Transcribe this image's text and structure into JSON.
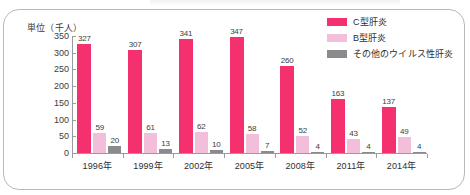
{
  "chart_data": {
    "type": "bar",
    "title": "",
    "unit_label": "単位（千人）",
    "xlabel": "",
    "ylabel": "",
    "categories": [
      "1996年",
      "1999年",
      "2002年",
      "2005年",
      "2008年",
      "2011年",
      "2014年"
    ],
    "series": [
      {
        "name": "C型肝炎",
        "color": "#F5306E",
        "values": [
          327,
          307,
          341,
          347,
          260,
          163,
          137
        ]
      },
      {
        "name": "B型肝炎",
        "color": "#F3BEDA",
        "values": [
          59,
          61,
          62,
          58,
          52,
          43,
          49
        ]
      },
      {
        "name": "その他のウイルス性肝炎",
        "color": "#8b8b8f",
        "values": [
          20,
          13,
          10,
          7,
          4,
          4,
          4
        ]
      }
    ],
    "ylim": [
      0,
      350
    ],
    "yticks": [
      0,
      50,
      100,
      150,
      200,
      250,
      300,
      350
    ],
    "ytick_labels": [
      "0",
      "50",
      "100",
      "150",
      "200",
      "250",
      "300",
      "350"
    ],
    "grid": false,
    "legend_position": "top-right"
  },
  "legend": {
    "items": [
      {
        "label": "C型肝炎",
        "color": "#F5306E"
      },
      {
        "label": "B型肝炎",
        "color": "#F3BEDA"
      },
      {
        "label": "その他のウイルス性肝炎",
        "color": "#8b8b8f"
      }
    ]
  }
}
